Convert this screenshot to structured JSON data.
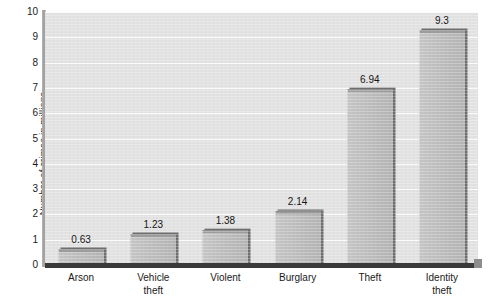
{
  "chart_data": {
    "type": "bar",
    "title": "",
    "xlabel": "",
    "ylabel": "Number of crimes in millions",
    "categories": [
      "Arson",
      "Vehicle\ntheft",
      "Violent",
      "Burglary",
      "Theft",
      "Identity\ntheft"
    ],
    "values": [
      0.63,
      1.23,
      1.38,
      2.14,
      6.94,
      9.3
    ],
    "value_labels": [
      "0.63",
      "1.23",
      "1.38",
      "2.14",
      "6.94",
      "9.3"
    ],
    "ylim": [
      0,
      10
    ],
    "yticks": [
      0,
      1,
      2,
      3,
      4,
      5,
      6,
      7,
      8,
      9,
      10
    ],
    "ytick_labels": [
      "0",
      "1",
      "2",
      "3",
      "4",
      "5",
      "6",
      "7",
      "8",
      "9",
      "10"
    ],
    "grid": true,
    "legend": false,
    "colors": {
      "bar_fill": "#bdbdbd",
      "bar_edge": "#6f6f6f",
      "plot_background": "#e2e2e2",
      "gridline": "#fbfbfb",
      "axis": "#3a3a3a",
      "text": "#1a1a1a",
      "figure_background": "#ffffff"
    }
  }
}
